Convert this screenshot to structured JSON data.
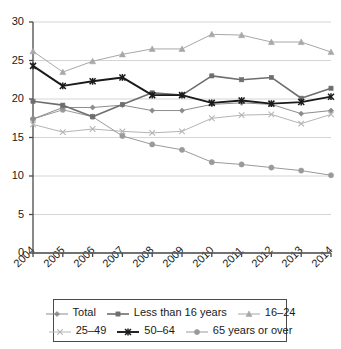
{
  "chart_data": {
    "type": "line",
    "title": "",
    "subtitle": "",
    "xlabel": "",
    "ylabel": "",
    "xlim": [
      2004,
      2014
    ],
    "ylim": [
      0,
      30
    ],
    "yticks": [
      0,
      5,
      10,
      15,
      20,
      25,
      30
    ],
    "ytick_labels": [
      "0",
      "5",
      "10",
      "15",
      "20",
      "25",
      "30"
    ],
    "grid": true,
    "grid_axis": "y",
    "legend_position": "bottom",
    "categories": [
      2004,
      2005,
      2006,
      2007,
      2008,
      2009,
      2010,
      2011,
      2012,
      2013,
      2014
    ],
    "xtick_labels": [
      "2004",
      "2005",
      "2006",
      "2007",
      "2008",
      "2009",
      "2010",
      "2011",
      "2012",
      "2013",
      "2014"
    ],
    "series": [
      {
        "name": "Total",
        "marker": "diamond",
        "color": "#8c8c8c",
        "values": [
          17.4,
          18.9,
          18.9,
          19.2,
          18.5,
          18.5,
          19.3,
          19.5,
          19.3,
          18.1,
          18.5
        ]
      },
      {
        "name": "Less than 16 years",
        "marker": "square",
        "color": "#6e6e6e",
        "values": [
          19.7,
          19.2,
          17.7,
          19.3,
          20.8,
          20.5,
          23.0,
          22.5,
          22.8,
          20.1,
          21.4
        ]
      },
      {
        "name": "16–24",
        "marker": "triangle",
        "color": "#a8a8a8",
        "values": [
          26.2,
          23.5,
          24.9,
          25.8,
          26.5,
          26.5,
          28.4,
          28.3,
          27.4,
          27.4,
          26.1
        ]
      },
      {
        "name": "25–49",
        "marker": "cross",
        "color": "#b5b5b5",
        "values": [
          16.7,
          15.7,
          16.1,
          15.8,
          15.6,
          15.8,
          17.5,
          17.9,
          18.0,
          16.8,
          18.0
        ]
      },
      {
        "name": "50–64",
        "marker": "asterisk",
        "color": "#1a1a1a",
        "values": [
          24.3,
          21.7,
          22.3,
          22.8,
          20.5,
          20.5,
          19.5,
          19.8,
          19.4,
          19.6,
          20.3
        ]
      },
      {
        "name": "65 years or over",
        "marker": "circle",
        "color": "#9a9a9a",
        "values": [
          17.4,
          18.6,
          17.7,
          15.2,
          14.1,
          13.4,
          11.8,
          11.5,
          11.1,
          10.7,
          10.1
        ]
      }
    ]
  },
  "legend": {
    "rows": [
      [
        {
          "label": "Total",
          "marker": "diamond",
          "color": "#8c8c8c"
        },
        {
          "label": "Less than 16 years",
          "marker": "square",
          "color": "#6e6e6e"
        },
        {
          "label": "16–24",
          "marker": "triangle",
          "color": "#a8a8a8"
        }
      ],
      [
        {
          "label": "25–49",
          "marker": "cross",
          "color": "#b5b5b5"
        },
        {
          "label": "50–64",
          "marker": "asterisk",
          "color": "#1a1a1a"
        },
        {
          "label": "65 years or over",
          "marker": "circle",
          "color": "#9a9a9a"
        }
      ]
    ]
  },
  "axes": {
    "y_tick_labels": [
      "30",
      "25",
      "20",
      "15",
      "10",
      "5",
      "0"
    ],
    "x_tick_labels": [
      "2004",
      "2005",
      "2006",
      "2007",
      "2008",
      "2009",
      "2010",
      "2011",
      "2012",
      "2013",
      "2014"
    ]
  },
  "colors": {
    "axis": "#4a4a4a",
    "grid": "#d0d0d0",
    "text": "#1a1a1a",
    "background": "#ffffff"
  }
}
